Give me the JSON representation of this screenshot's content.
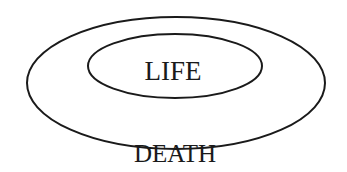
{
  "diagram": {
    "inner_label": "LIFE",
    "outer_label": "DEATH",
    "stroke_color": "#1a1a1a",
    "background": "#ffffff"
  }
}
